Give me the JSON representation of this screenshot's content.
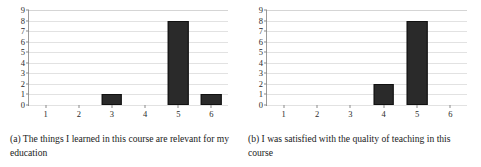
{
  "figure": {
    "background_color": "#ffffff",
    "bar_color": "#2a2a2a",
    "grid_color": "#e2e2e2",
    "axis_color": "#6f6f6f"
  },
  "subfigures": [
    {
      "label": "(a)",
      "caption": "(a) The things I learned in this course are relevant for my education",
      "chart_data": {
        "type": "bar",
        "title": "",
        "xlabel": "",
        "ylabel": "",
        "categories": [
          "1",
          "2",
          "3",
          "4",
          "5",
          "6"
        ],
        "values": [
          0,
          0,
          1,
          0,
          8,
          1
        ],
        "xlim": [
          0.5,
          6.5
        ],
        "ylim": [
          0,
          9
        ],
        "yticks": [
          0,
          1,
          2,
          3,
          4,
          5,
          6,
          7,
          8,
          9
        ],
        "xticks": [
          "1",
          "2",
          "3",
          "4",
          "5",
          "6"
        ],
        "grid": true,
        "grid_axis": "y",
        "legend": false
      }
    },
    {
      "label": "(b)",
      "caption": "(b) I was satisfied with the quality of teaching in this course",
      "chart_data": {
        "type": "bar",
        "title": "",
        "xlabel": "",
        "ylabel": "",
        "categories": [
          "1",
          "2",
          "3",
          "4",
          "5",
          "6"
        ],
        "values": [
          0,
          0,
          0,
          2,
          8,
          0
        ],
        "xlim": [
          0.5,
          6.5
        ],
        "ylim": [
          0,
          9
        ],
        "yticks": [
          0,
          1,
          2,
          3,
          4,
          5,
          6,
          7,
          8,
          9
        ],
        "xticks": [
          "1",
          "2",
          "3",
          "4",
          "5",
          "6"
        ],
        "grid": true,
        "grid_axis": "y",
        "legend": false
      }
    }
  ],
  "chart_data": [
    {
      "type": "bar",
      "title": "(a) The things I learned in this course are relevant for my education",
      "xlabel": "",
      "ylabel": "",
      "categories": [
        "1",
        "2",
        "3",
        "4",
        "5",
        "6"
      ],
      "values": [
        0,
        0,
        1,
        0,
        8,
        1
      ],
      "ylim": [
        0,
        9
      ],
      "xlim": [
        0.5,
        6.5
      ],
      "yticks": [
        0,
        1,
        2,
        3,
        4,
        5,
        6,
        7,
        8,
        9
      ],
      "grid": true,
      "legend": false
    },
    {
      "type": "bar",
      "title": "(b) I was satisfied with the quality of teaching in this course",
      "xlabel": "",
      "ylabel": "",
      "categories": [
        "1",
        "2",
        "3",
        "4",
        "5",
        "6"
      ],
      "values": [
        0,
        0,
        0,
        2,
        8,
        0
      ],
      "ylim": [
        0,
        9
      ],
      "xlim": [
        0.5,
        6.5
      ],
      "yticks": [
        0,
        1,
        2,
        3,
        4,
        5,
        6,
        7,
        8,
        9
      ],
      "grid": true,
      "legend": false
    }
  ]
}
